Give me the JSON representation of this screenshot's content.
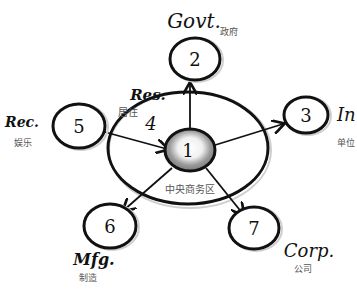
{
  "diagram": {
    "type": "concentric-zone-model",
    "center": {
      "number": "1",
      "label_zh": "中央商务区"
    },
    "ring": {
      "number": "4",
      "label_en": "Res.",
      "label_zh": "居住"
    },
    "nodes": [
      {
        "id": "2",
        "number": "2",
        "label_en": "Govt.",
        "label_zh": "政府"
      },
      {
        "id": "3",
        "number": "3",
        "label_en": "In",
        "label_zh": "单位"
      },
      {
        "id": "5",
        "number": "5",
        "label_en": "Rec.",
        "label_zh": "娱乐"
      },
      {
        "id": "6",
        "number": "6",
        "label_en": "Mfg.",
        "label_zh": "制造"
      },
      {
        "id": "7",
        "number": "7",
        "label_en": "Corp.",
        "label_zh": "公司"
      }
    ],
    "edges": [
      {
        "from": "1",
        "to": "2"
      },
      {
        "from": "1",
        "to": "3"
      },
      {
        "from": "5",
        "to": "1"
      },
      {
        "from": "1",
        "to": "6"
      },
      {
        "from": "1",
        "to": "7"
      }
    ]
  }
}
